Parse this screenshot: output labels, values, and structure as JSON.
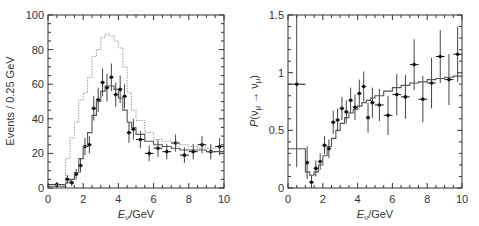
{
  "chart_data": [
    {
      "type": "line",
      "title": "",
      "xlabel": "E_ν/GeV",
      "ylabel": "Events/0.25 GeV",
      "xlim": [
        0,
        10
      ],
      "ylim": [
        0,
        100
      ],
      "xticks": [
        "0",
        "2",
        "4",
        "6",
        "8",
        "10"
      ],
      "yticks": [
        "0",
        "20",
        "40",
        "60",
        "80",
        "100"
      ],
      "grid": false,
      "legend": null,
      "series": [
        {
          "name": "data",
          "style": "points-with-errorbars",
          "x": [
            0.5,
            1.1,
            1.35,
            1.6,
            1.85,
            2.1,
            2.35,
            2.6,
            2.85,
            3.1,
            3.35,
            3.6,
            3.85,
            4.1,
            4.35,
            4.6,
            4.85,
            5.25,
            5.75,
            6.25,
            6.75,
            7.25,
            7.75,
            8.25,
            8.75,
            9.25,
            9.75
          ],
          "values": [
            2,
            5,
            3,
            8,
            13,
            24,
            25,
            46,
            51,
            61,
            58,
            64,
            54,
            57,
            53,
            32,
            34,
            28,
            20,
            23,
            21,
            26,
            19,
            21,
            25,
            21,
            24
          ],
          "yerr": [
            1.5,
            2.5,
            2,
            3,
            4,
            5,
            5,
            7,
            7,
            8,
            8,
            8,
            7,
            8,
            7,
            6,
            6,
            5,
            4.5,
            5,
            4.5,
            5,
            4.5,
            4.5,
            5,
            4.5,
            5
          ],
          "xerr": [
            0.5,
            0.125,
            0.125,
            0.125,
            0.125,
            0.125,
            0.125,
            0.125,
            0.125,
            0.125,
            0.125,
            0.125,
            0.125,
            0.125,
            0.125,
            0.125,
            0.125,
            0.25,
            0.25,
            0.25,
            0.25,
            0.25,
            0.25,
            0.25,
            0.25,
            0.25,
            0.25
          ]
        },
        {
          "name": "no-oscillation expectation",
          "style": "dotted-step",
          "edges": [
            0,
            1,
            1.25,
            1.5,
            1.75,
            2,
            2.25,
            2.5,
            2.75,
            3,
            3.25,
            3.5,
            3.75,
            4,
            4.25,
            4.5,
            4.75,
            5,
            5.5,
            6,
            6.5,
            7,
            7.5,
            8,
            8.5,
            9,
            9.5,
            10
          ],
          "values": [
            2,
            17,
            29,
            38,
            51,
            55,
            64,
            76,
            80,
            87,
            89,
            88,
            85,
            81,
            70,
            55,
            45,
            39,
            32,
            28,
            27,
            26,
            25,
            24,
            23,
            23,
            23
          ]
        },
        {
          "name": "best-fit oscillation",
          "style": "solid-step",
          "edges": [
            0,
            1,
            1.25,
            1.5,
            1.75,
            2,
            2.25,
            2.5,
            2.75,
            3,
            3.25,
            3.5,
            3.75,
            4,
            4.25,
            4.5,
            4.75,
            5,
            5.5,
            6,
            6.5,
            7,
            7.5,
            8,
            8.5,
            9,
            9.5,
            10
          ],
          "values": [
            1,
            3,
            5,
            9,
            17,
            24,
            32,
            42,
            50,
            56,
            59,
            59,
            57,
            52,
            45,
            38,
            35,
            31,
            27,
            25,
            24,
            23,
            22,
            22,
            22,
            21,
            21
          ]
        }
      ]
    },
    {
      "type": "line",
      "title": "",
      "xlabel": "E_ν/GeV",
      "ylabel": "P(ν_μ → ν_μ)",
      "xlim": [
        0,
        10
      ],
      "ylim": [
        0,
        1.5
      ],
      "xticks": [
        "0",
        "2",
        "4",
        "6",
        "8",
        "10"
      ],
      "yticks": [
        "0",
        "0.5",
        "1",
        "1.5"
      ],
      "grid": false,
      "legend": null,
      "series": [
        {
          "name": "data ratio",
          "style": "points-with-errorbars",
          "x": [
            0.5,
            1.1,
            1.35,
            1.6,
            1.85,
            2.1,
            2.35,
            2.6,
            2.85,
            3.1,
            3.35,
            3.6,
            3.85,
            4.1,
            4.35,
            4.6,
            4.85,
            5.25,
            5.75,
            6.25,
            6.75,
            7.25,
            7.75,
            8.25,
            8.75,
            9.25,
            9.75
          ],
          "values": [
            0.9,
            0.22,
            0.05,
            0.17,
            0.23,
            0.37,
            0.34,
            0.57,
            0.59,
            0.69,
            0.66,
            0.76,
            0.7,
            0.82,
            0.88,
            0.61,
            0.74,
            0.72,
            0.63,
            0.81,
            0.79,
            1.07,
            0.77,
            0.91,
            1.14,
            0.94,
            1.16
          ],
          "yerr": [
            0.72,
            0.14,
            0.06,
            0.07,
            0.07,
            0.08,
            0.08,
            0.1,
            0.1,
            0.1,
            0.1,
            0.11,
            0.11,
            0.12,
            0.13,
            0.13,
            0.13,
            0.14,
            0.17,
            0.18,
            0.19,
            0.22,
            0.2,
            0.22,
            0.23,
            0.22,
            0.24
          ],
          "xerr": [
            0.5,
            0.125,
            0.125,
            0.125,
            0.125,
            0.125,
            0.125,
            0.125,
            0.125,
            0.125,
            0.125,
            0.125,
            0.125,
            0.125,
            0.125,
            0.125,
            0.125,
            0.25,
            0.25,
            0.25,
            0.25,
            0.25,
            0.25,
            0.25,
            0.25,
            0.25,
            0.25
          ]
        },
        {
          "name": "best-fit oscillation probability",
          "style": "solid-step",
          "edges": [
            0,
            1,
            1.25,
            1.5,
            1.75,
            2,
            2.25,
            2.5,
            2.75,
            3,
            3.25,
            3.5,
            3.75,
            4,
            4.25,
            4.5,
            4.75,
            5,
            5.5,
            6,
            6.5,
            7,
            7.5,
            8,
            8.5,
            9,
            9.5,
            10
          ],
          "values": [
            0.34,
            0.14,
            0.11,
            0.14,
            0.2,
            0.28,
            0.36,
            0.43,
            0.5,
            0.56,
            0.61,
            0.65,
            0.68,
            0.71,
            0.74,
            0.76,
            0.78,
            0.8,
            0.84,
            0.87,
            0.89,
            0.91,
            0.92,
            0.94,
            0.95,
            0.96,
            0.97
          ]
        }
      ]
    }
  ],
  "panels": [
    {
      "frame": {
        "x0": 48,
        "x1": 224,
        "y0": 15,
        "y1": 188
      },
      "ylabel_display": "Events / 0.25 GeV",
      "xlabel_main": "E",
      "xlabel_sub": "ν",
      "xlabel_rest": "/GeV"
    },
    {
      "frame": {
        "x0": 288,
        "x1": 462,
        "y0": 15,
        "y1": 188
      },
      "ylabel_main": "P",
      "ylabel_paren_open": "(ν",
      "ylabel_sub1": "μ",
      "ylabel_arrow": " → ν",
      "ylabel_sub2": "μ",
      "ylabel_paren_close": ")",
      "xlabel_main": "E",
      "xlabel_sub": "ν",
      "xlabel_rest": "/GeV"
    }
  ],
  "colors": {
    "axis": "#333333",
    "data": "#111111",
    "errorbar": "#444444",
    "fit_line": "#555555",
    "dotted_line": "#888888"
  }
}
